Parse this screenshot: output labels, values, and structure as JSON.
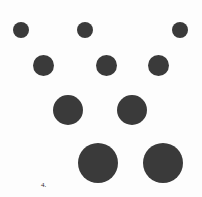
{
  "figure": {
    "caption_label": "4.",
    "caption_x": 41,
    "caption_y": 182,
    "background_color": "#fdfdfd",
    "circle_color": "#3a3a3a",
    "width": 202,
    "height": 197
  },
  "chart_data": {
    "type": "scatter",
    "title": "",
    "subtitle": "",
    "xlabel": "",
    "ylabel": "",
    "grid": false,
    "legend": null,
    "annotations": [
      "4."
    ],
    "xlim": [
      0,
      202
    ],
    "ylim": [
      0,
      197
    ],
    "note": "Array of solid dark filled circles arranged in four rows of progressively increasing diameter; sizes given in pixels.",
    "rows": [
      {
        "row": 1,
        "diameter": 16,
        "count": 3,
        "center_y": 30,
        "center_x": [
          21,
          85,
          180
        ]
      },
      {
        "row": 2,
        "diameter": 21,
        "count": 3,
        "center_y": 65,
        "center_x": [
          43,
          106,
          158
        ]
      },
      {
        "row": 3,
        "diameter": 30,
        "count": 2,
        "center_y": 110,
        "center_x": [
          68,
          132
        ]
      },
      {
        "row": 4,
        "diameter": 40,
        "count": 2,
        "center_y": 163,
        "center_x": [
          98,
          163
        ]
      }
    ],
    "points": [
      {
        "id": "c1",
        "x": 21,
        "y": 30,
        "size": 16
      },
      {
        "id": "c2",
        "x": 85,
        "y": 30,
        "size": 16
      },
      {
        "id": "c3",
        "x": 180,
        "y": 30,
        "size": 16
      },
      {
        "id": "c4",
        "x": 43,
        "y": 65,
        "size": 21
      },
      {
        "id": "c5",
        "x": 106,
        "y": 65,
        "size": 21
      },
      {
        "id": "c6",
        "x": 158,
        "y": 65,
        "size": 21
      },
      {
        "id": "c7",
        "x": 68,
        "y": 110,
        "size": 30
      },
      {
        "id": "c8",
        "x": 132,
        "y": 110,
        "size": 30
      },
      {
        "id": "c9",
        "x": 98,
        "y": 163,
        "size": 40
      },
      {
        "id": "c10",
        "x": 163,
        "y": 163,
        "size": 40
      }
    ]
  }
}
